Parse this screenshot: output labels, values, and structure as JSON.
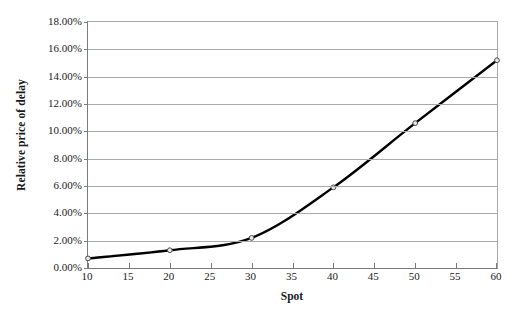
{
  "chart_data": {
    "type": "line",
    "title": "",
    "xlabel": "Spot",
    "ylabel": "Relative price of delay",
    "x": [
      10,
      20,
      30,
      40,
      50,
      60
    ],
    "values": [
      0.7,
      1.3,
      2.2,
      5.9,
      10.6,
      15.2
    ],
    "series": [
      {
        "name": "Relative price of delay",
        "x": [
          10,
          20,
          30,
          40,
          50,
          60
        ],
        "values": [
          0.7,
          1.3,
          2.2,
          5.9,
          10.6,
          15.2
        ]
      }
    ],
    "xlim": [
      10,
      60
    ],
    "ylim": [
      0,
      18
    ],
    "xticks": [
      10,
      15,
      20,
      25,
      30,
      35,
      40,
      45,
      50,
      55,
      60
    ],
    "yticks": [
      0,
      2,
      4,
      6,
      8,
      10,
      12,
      14,
      16,
      18
    ],
    "xtick_labels": [
      "10",
      "15",
      "20",
      "25",
      "30",
      "35",
      "40",
      "45",
      "50",
      "55",
      "60"
    ],
    "ytick_labels": [
      "0.00%",
      "2.00%",
      "4.00%",
      "6.00%",
      "8.00%",
      "10.00%",
      "12.00%",
      "14.00%",
      "16.00%",
      "18.00%"
    ],
    "grid": "horizontal",
    "legend": "none",
    "marker": "open-circle",
    "line_color": "#000000",
    "grid_color": "#a9a9a9",
    "axis_color": "#7b7b7b",
    "background": "#ffffff"
  }
}
